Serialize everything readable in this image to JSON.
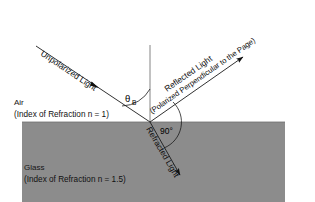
{
  "diagram": {
    "background_color": "#ffffff",
    "line_color": "#1a1a1a",
    "media": {
      "upper": {
        "name": "Air",
        "index_text": "(Index of Refraction n = 1)",
        "index_value": 1.0,
        "fill": "#ffffff"
      },
      "lower": {
        "name": "Glass",
        "index_text": "(Index of Refraction n = 1.5)",
        "index_value": 1.5,
        "fill": "#8c8c8c"
      }
    },
    "rays": {
      "incident": {
        "label": "Unpolarized Light",
        "sublabel": "",
        "x1": 36,
        "y1": 46,
        "x2": 150,
        "y2": 122,
        "arrow_t": 0.52,
        "label_x": 40,
        "label_y": 58,
        "label_rotation": 33.7
      },
      "reflected": {
        "label": "Reflected Light",
        "sublabel": "(Polarized Perpendicular to the Page)",
        "x1": 150,
        "y1": 122,
        "x2": 246,
        "y2": 55,
        "arrow_t": 1.0,
        "label_x": 168,
        "label_y": 93,
        "label_rotation": -34.9,
        "sublabel_x": 152,
        "sublabel_y": 114,
        "sublabel_rotation": -34.9
      },
      "refracted": {
        "label": "Refracted Light",
        "sublabel": "",
        "x1": 150,
        "y1": 122,
        "x2": 184,
        "y2": 180,
        "arrow_t": 1.0,
        "label_x": 145,
        "label_y": 128,
        "label_rotation": 59.6
      },
      "normal": {
        "label": "",
        "x1": 150,
        "y1": 45,
        "x2": 150,
        "y2": 122
      }
    },
    "angles": [
      {
        "name": "brewster-angle",
        "symbol": "θ",
        "subscript": "B",
        "label_x": 126,
        "label_y": 101,
        "sub_x": 133,
        "sub_y": 104,
        "arc_radius": 33
      },
      {
        "name": "right-angle",
        "symbol": "90°",
        "subscript": "",
        "label_x": 161,
        "label_y": 133,
        "sub_x": 0,
        "sub_y": 0,
        "arc_radius": 28
      }
    ],
    "interface": {
      "y": 122,
      "x_left": 22,
      "x_right": 285
    },
    "glass_block": {
      "x": 22,
      "y": 122,
      "width": 263,
      "height": 80
    },
    "labels": {
      "air_name_x": 14,
      "air_name_y": 105,
      "air_index_x": 14,
      "air_index_y": 117,
      "glass_name_x": 24,
      "glass_name_y": 170,
      "glass_index_x": 24,
      "glass_index_y": 182
    }
  }
}
